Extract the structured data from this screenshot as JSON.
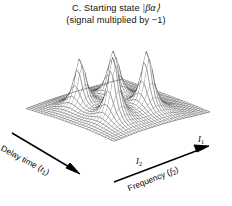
{
  "figure": {
    "panel_letter": "C.",
    "title_prefix": "C. Starting state ",
    "title_ket": "|βα⟩",
    "subtitle": "(signal multiplied by −1)",
    "background_color": "#ffffff",
    "mesh_color": "#1a1a1a",
    "width": 232,
    "height": 206
  },
  "axes": {
    "x_axis": {
      "name": "frequency-axis",
      "label_text": "Frequency (",
      "label_symbol": "f",
      "label_subscript": "2",
      "label_suffix": ")",
      "arrow": "right-up"
    },
    "y_axis": {
      "name": "delay-time-axis",
      "label_text": "Delay time (",
      "label_symbol": "t",
      "label_subscript": "1",
      "label_suffix": ")",
      "arrow": "down-right"
    },
    "ticks": [
      {
        "name": "tick-i2",
        "symbol": "I",
        "subscript": "2"
      },
      {
        "name": "tick-i1",
        "symbol": "I",
        "subscript": "1"
      }
    ]
  },
  "chart_data": {
    "type": "surface",
    "title": "C. Starting state |βα⟩ (signal multiplied by −1)",
    "xlabel": "Frequency (f2)",
    "ylabel": "Delay time (t1)",
    "zlabel": "",
    "grid": true,
    "legend": false,
    "projection": {
      "azimuth_deg": -36,
      "elevation_deg": 26
    },
    "nx": 38,
    "ny": 30,
    "xlim": [
      0,
      1
    ],
    "ylim": [
      0,
      1
    ],
    "zlim": [
      0,
      1
    ],
    "peaks": [
      {
        "name": "diagonal-peak-1",
        "x": 0.27,
        "y": 0.3,
        "amplitude": 1.0,
        "width_x": 0.055,
        "width_y": 0.06
      },
      {
        "name": "cross-peak-a",
        "x": 0.62,
        "y": 0.3,
        "amplitude": 0.93,
        "width_x": 0.055,
        "width_y": 0.06
      },
      {
        "name": "cross-peak-b",
        "x": 0.27,
        "y": 0.68,
        "amplitude": 0.78,
        "width_x": 0.055,
        "width_y": 0.06
      },
      {
        "name": "diagonal-peak-2",
        "x": 0.62,
        "y": 0.68,
        "amplitude": 0.74,
        "width_x": 0.055,
        "width_y": 0.06
      }
    ],
    "x_tick_labels": [
      "I2",
      "I1"
    ],
    "baseline": 0.0
  }
}
